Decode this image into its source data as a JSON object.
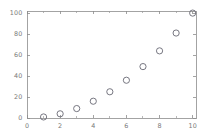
{
  "chart_data": {
    "type": "scatter",
    "title": "",
    "subtitle": "",
    "xlabel": "",
    "ylabel": "",
    "x": [
      1,
      2,
      3,
      4,
      5,
      6,
      7,
      8,
      9,
      10
    ],
    "values": [
      1,
      4,
      9,
      16,
      25,
      36,
      49,
      64,
      81,
      100
    ],
    "series": [
      {
        "name": "",
        "x": [
          1,
          2,
          3,
          4,
          5,
          6,
          7,
          8,
          9,
          10
        ],
        "values": [
          1,
          4,
          9,
          16,
          25,
          36,
          49,
          64,
          81,
          100
        ]
      }
    ],
    "xlim": [
      0,
      10.2
    ],
    "ylim": [
      0,
      102
    ],
    "xticks": [
      0,
      2,
      4,
      6,
      8,
      10
    ],
    "xtick_labels": [
      "0",
      "2",
      "4",
      "6",
      "8",
      "10"
    ],
    "xticks_minor": [
      1,
      3,
      5,
      7,
      9
    ],
    "yticks": [
      0,
      20,
      40,
      60,
      80,
      100
    ],
    "ytick_labels": [
      "0",
      "20",
      "40",
      "60",
      "80",
      "100"
    ],
    "yticks_minor": [],
    "grid": false,
    "legend": null,
    "legend_position": "none",
    "annotations": [],
    "marker": "open-circle",
    "marker_size": 3.1,
    "marker_color": "#70707a",
    "marker_fill": "none",
    "axis_color": "#8c8c8c",
    "tick_label_color": "#7a7a7a",
    "background_color": "#ffffff",
    "frame": "box"
  },
  "figure": {
    "width": 210,
    "height": 135,
    "plot_left": 27,
    "plot_right": 196,
    "plot_top": 11,
    "plot_bottom": 118
  }
}
